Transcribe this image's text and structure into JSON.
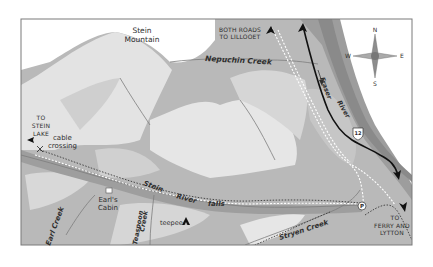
{
  "map": {
    "title": "Stein River area map",
    "colors": {
      "frame": "#7a7a7a",
      "valley": "#b4b4b4",
      "valley_dark": "#9e9e9e",
      "ridge_light": "#e4e4e4",
      "ridge_mid": "#cdcdcd",
      "river": "#8a8a8a",
      "highway": "#111111",
      "paper": "#ffffff"
    },
    "labels": {
      "stein_mountain_line1": "Stein",
      "stein_mountain_line2": "Mountain",
      "both_roads_line1": "BOTH ROADS",
      "both_roads_line2": "TO LILLOOET",
      "nepuchin_creek": "Nepuchin Creek",
      "fraser": "Fraser",
      "river_word": "River",
      "to_stein_lake_1": "TO",
      "to_stein_lake_2": "STEIN",
      "to_stein_lake_3": "LAKE",
      "cable_1": "cable",
      "cable_2": "crossing",
      "stein": "Stein",
      "stein_river_word": "River",
      "falls": "falls",
      "earls_cabin_1": "Earl's",
      "earls_cabin_2": "Cabin",
      "teaspoon_1": "Teaspoon",
      "teaspoon_2": "Creek",
      "earl_creek": "Earl Creek",
      "teepee": "teepee",
      "stryen_creek": "Stryen Creek",
      "to_ferry_1": "TO",
      "to_ferry_2": "FERRY AND",
      "to_ferry_3": "LYTTON",
      "highway_number": "12",
      "parking": "P"
    },
    "compass": {
      "n": "N",
      "s": "S",
      "e": "E",
      "w": "W"
    },
    "icons": [
      "compass-rose-icon",
      "highway-shield-icon",
      "parking-icon",
      "teepee-icon",
      "cabin-icon",
      "cable-crossing-icon",
      "direction-arrow-icon"
    ]
  }
}
